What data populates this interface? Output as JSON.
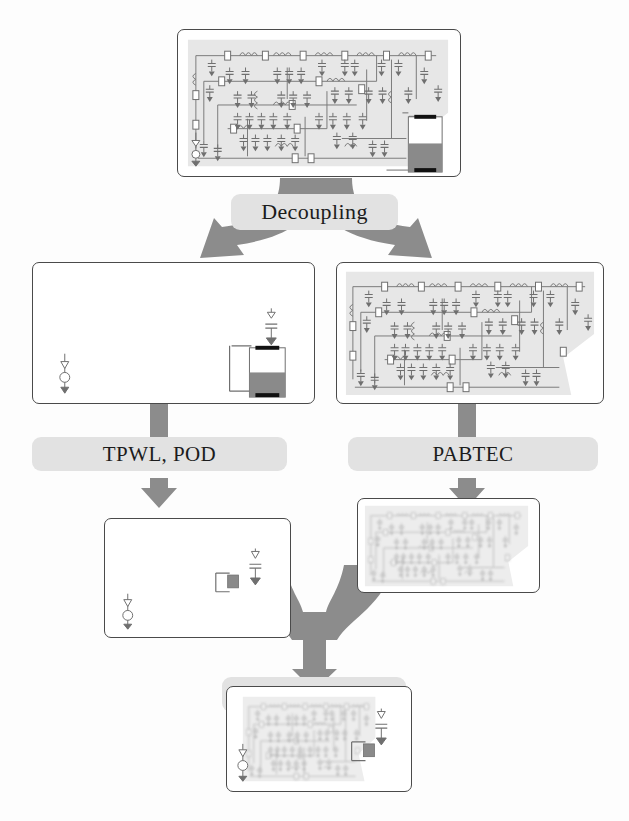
{
  "diagram": {
    "type": "flowchart",
    "background_color": "#fdfdfd",
    "arrow_color": "#8c8c8c",
    "label_background_color": "#e2e2e2",
    "box_border_color": "#4a4a4a",
    "circuit_tint_color": "#e6e6e6",
    "nonlinear_fill_color": "#8a8a8a"
  },
  "nodes": [
    {
      "id": "full-coupled-system",
      "role": "original coupled nonlinear circuit",
      "contents": "dense linear RLC network plus nonlinear element",
      "has_linear_network": true,
      "linear_network_faded": false,
      "has_nonlinear_element": true,
      "nonlinear_element_style": "large",
      "has_source": true
    },
    {
      "id": "nonlinear-subsystem",
      "role": "decoupled nonlinear subsystem",
      "contents": "nonlinear element and source only",
      "has_linear_network": false,
      "linear_network_faded": false,
      "has_nonlinear_element": true,
      "nonlinear_element_style": "large",
      "has_source": true
    },
    {
      "id": "linear-subsystem",
      "role": "decoupled linear subsystem",
      "contents": "dense linear RLC network",
      "has_linear_network": true,
      "linear_network_faded": false,
      "has_nonlinear_element": false,
      "has_source": false
    },
    {
      "id": "reduced-nonlinear-subsystem",
      "role": "reduced nonlinear subsystem",
      "contents": "compressed nonlinear element and source",
      "has_linear_network": false,
      "linear_network_faded": false,
      "has_nonlinear_element": true,
      "nonlinear_element_style": "small",
      "has_source": true
    },
    {
      "id": "reduced-linear-subsystem",
      "role": "reduced linear subsystem",
      "contents": "faded reduced-order linear network",
      "has_linear_network": true,
      "linear_network_faded": true,
      "has_nonlinear_element": false,
      "has_source": false
    },
    {
      "id": "reduced-coupled-system",
      "role": "reduced coupled system",
      "contents": "faded reduced linear network plus compressed nonlinear element",
      "has_linear_network": true,
      "linear_network_faded": true,
      "has_nonlinear_element": true,
      "nonlinear_element_style": "small",
      "has_source": true
    }
  ],
  "steps": [
    {
      "id": "decoupling",
      "label": "Decoupling",
      "arrow_type": "fork-split",
      "from": "full-coupled-system",
      "to": [
        "nonlinear-subsystem",
        "linear-subsystem"
      ]
    },
    {
      "id": "tpwl-pod",
      "label": "TPWL, POD",
      "arrow_type": "straight-down",
      "from": "nonlinear-subsystem",
      "to": [
        "reduced-nonlinear-subsystem"
      ]
    },
    {
      "id": "pabtec",
      "label": "PABTEC",
      "arrow_type": "straight-down",
      "from": "linear-subsystem",
      "to": [
        "reduced-linear-subsystem"
      ]
    },
    {
      "id": "recoupling",
      "label": "Recoupling",
      "arrow_type": "fork-merge",
      "from": [
        "reduced-nonlinear-subsystem",
        "reduced-linear-subsystem"
      ],
      "to": "reduced-coupled-system"
    }
  ]
}
